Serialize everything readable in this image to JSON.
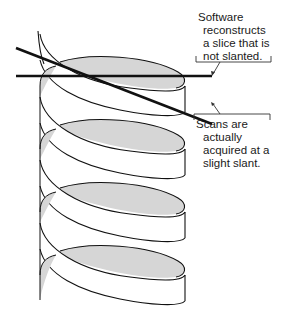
{
  "annotations": {
    "reconstructed": {
      "lines": [
        "Software",
        "reconstructs",
        "a slice that is",
        "not slanted."
      ]
    },
    "acquired": {
      "lines": [
        "Scans are",
        "actually",
        "acquired at a",
        "slight slant."
      ]
    }
  },
  "colors": {
    "stroke": "#111111",
    "ribbon_inner": "#d6d6d6",
    "ribbon_outer": "#ffffff"
  }
}
